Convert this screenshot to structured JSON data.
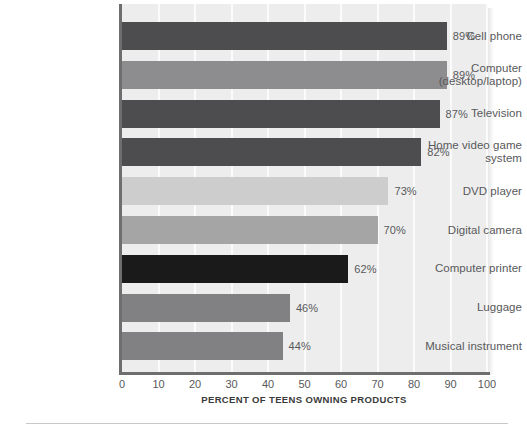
{
  "chart_data": {
    "type": "bar",
    "orientation": "horizontal",
    "title": "",
    "xlabel": "PERCENT OF TEENS OWNING PRODUCTS",
    "ylabel": "",
    "xlim": [
      0,
      100
    ],
    "grid": true,
    "legend": "none",
    "xticks": [
      "0",
      "10",
      "20",
      "30",
      "40",
      "50",
      "60",
      "70",
      "80",
      "90",
      "100"
    ],
    "categories": [
      "Cell phone",
      "Computer\n(desktop/laptop)",
      "Television",
      "Home video game\nsystem",
      "DVD player",
      "Digital camera",
      "Computer printer",
      "Luggage",
      "Musical instrument"
    ],
    "values": [
      89,
      89,
      87,
      82,
      73,
      70,
      62,
      46,
      44
    ],
    "value_labels": [
      "89%",
      "89%",
      "87%",
      "82%",
      "73%",
      "70%",
      "62%",
      "46%",
      "44%"
    ],
    "bar_colors": [
      "#4d4d4f",
      "#8d8d8f",
      "#4d4d4f",
      "#4d4d4f",
      "#cdcdce",
      "#a5a5a6",
      "#1a1a1a",
      "#818183",
      "#818183"
    ]
  },
  "bars": [
    {
      "label_line1": "Cell phone",
      "label_line2": "",
      "value": 89,
      "value_label": "89%",
      "color": "#4d4d4f"
    },
    {
      "label_line1": "Computer",
      "label_line2": "(desktop/laptop)",
      "value": 89,
      "value_label": "89%",
      "color": "#8d8d8f"
    },
    {
      "label_line1": "Television",
      "label_line2": "",
      "value": 87,
      "value_label": "87%",
      "color": "#4d4d4f"
    },
    {
      "label_line1": "Home video game",
      "label_line2": "system",
      "value": 82,
      "value_label": "82%",
      "color": "#4d4d4f"
    },
    {
      "label_line1": "DVD player",
      "label_line2": "",
      "value": 73,
      "value_label": "73%",
      "color": "#cdcdce"
    },
    {
      "label_line1": "Digital camera",
      "label_line2": "",
      "value": 70,
      "value_label": "70%",
      "color": "#a5a5a6"
    },
    {
      "label_line1": "Computer printer",
      "label_line2": "",
      "value": 62,
      "value_label": "62%",
      "color": "#1a1a1a"
    },
    {
      "label_line1": "Luggage",
      "label_line2": "",
      "value": 46,
      "value_label": "46%",
      "color": "#818183"
    },
    {
      "label_line1": "Musical instrument",
      "label_line2": "",
      "value": 44,
      "value_label": "44%",
      "color": "#818183"
    }
  ],
  "axis": {
    "title": "PERCENT OF TEENS OWNING PRODUCTS",
    "ticks": [
      "0",
      "10",
      "20",
      "30",
      "40",
      "50",
      "60",
      "70",
      "80",
      "90",
      "100"
    ]
  },
  "colors": {
    "plot_background": "#ededed",
    "gridline": "#fbfbfb",
    "axis_line": "#6e6e6e",
    "text": "#58595b",
    "axis_title_text": "#3a3a3a",
    "rule": "#c8c8c8"
  }
}
